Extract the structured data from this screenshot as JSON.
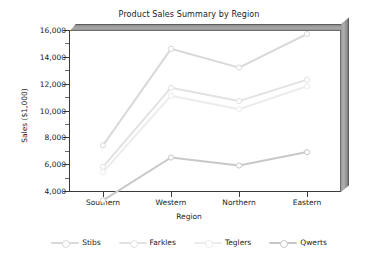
{
  "chart_data": {
    "type": "line",
    "title": "Product Sales Summary by Region",
    "xlabel": "Region",
    "ylabel": "Sales ($1,000)",
    "categories": [
      "Southern",
      "Western",
      "Northern",
      "Eastern"
    ],
    "ylim": [
      3000,
      16200
    ],
    "yticks": [
      4000,
      6000,
      8000,
      10000,
      12000,
      14000,
      16000
    ],
    "ytick_labels": [
      "4,000",
      "6,000",
      "8,000",
      "10,000",
      "12,000",
      "14,000",
      "16,000"
    ],
    "yminor_ticks": [
      5000,
      7000,
      9000,
      11000,
      13000,
      15000
    ],
    "grid": false,
    "legend_position": "bottom",
    "three_d_frame": true,
    "series": [
      {
        "name": "Stibs",
        "values": [
          7400,
          14600,
          13200,
          15700
        ],
        "color": "#d9d9d9",
        "marker": "circle"
      },
      {
        "name": "Farkles",
        "values": [
          5800,
          11700,
          10700,
          12300
        ],
        "color": "#e2e2e2",
        "marker": "circle"
      },
      {
        "name": "Teglers",
        "values": [
          5400,
          11100,
          10100,
          11800
        ],
        "color": "#ececec",
        "marker": "circle"
      },
      {
        "name": "Qwerts",
        "values": [
          3300,
          6500,
          5900,
          6900
        ],
        "color": "#c8c8c8",
        "marker": "circle"
      }
    ]
  },
  "legend": {
    "items": [
      {
        "label": "Stibs"
      },
      {
        "label": "Farkles"
      },
      {
        "label": "Teglers"
      },
      {
        "label": "Qwerts"
      }
    ]
  },
  "colors": {
    "background": "#ffffff",
    "text": "#1b1b1b",
    "axis": "#3a3a3a",
    "wall_top": "#a8a8a8",
    "wall_right": "#9a9a9a"
  }
}
